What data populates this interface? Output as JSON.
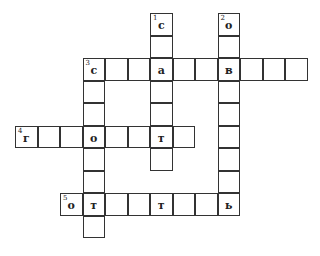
{
  "puzzle": {
    "cell_size": 22.5,
    "origin": {
      "x": 15,
      "y": 13
    },
    "cells": [
      {
        "r": 0,
        "c": 6,
        "num": "1",
        "ch": "с"
      },
      {
        "r": 1,
        "c": 6
      },
      {
        "r": 3,
        "c": 6
      },
      {
        "r": 4,
        "c": 6
      },
      {
        "r": 6,
        "c": 6
      },
      {
        "r": 0,
        "c": 9,
        "num": "2",
        "ch": "о"
      },
      {
        "r": 1,
        "c": 9
      },
      {
        "r": 3,
        "c": 9
      },
      {
        "r": 4,
        "c": 9
      },
      {
        "r": 5,
        "c": 9
      },
      {
        "r": 6,
        "c": 9
      },
      {
        "r": 7,
        "c": 9
      },
      {
        "r": 2,
        "c": 3,
        "num": "3",
        "ch": "с"
      },
      {
        "r": 2,
        "c": 4
      },
      {
        "r": 2,
        "c": 5
      },
      {
        "r": 2,
        "c": 6,
        "ch": "а"
      },
      {
        "r": 2,
        "c": 7
      },
      {
        "r": 2,
        "c": 8
      },
      {
        "r": 2,
        "c": 9,
        "ch": "в"
      },
      {
        "r": 2,
        "c": 10
      },
      {
        "r": 2,
        "c": 11
      },
      {
        "r": 2,
        "c": 12
      },
      {
        "r": 3,
        "c": 3
      },
      {
        "r": 4,
        "c": 3
      },
      {
        "r": 6,
        "c": 3
      },
      {
        "r": 7,
        "c": 3
      },
      {
        "r": 9,
        "c": 3
      },
      {
        "r": 5,
        "c": 0,
        "num": "4",
        "ch": "г"
      },
      {
        "r": 5,
        "c": 1
      },
      {
        "r": 5,
        "c": 2
      },
      {
        "r": 5,
        "c": 3,
        "ch": "о"
      },
      {
        "r": 5,
        "c": 4
      },
      {
        "r": 5,
        "c": 5
      },
      {
        "r": 5,
        "c": 6,
        "ch": "т"
      },
      {
        "r": 5,
        "c": 7
      },
      {
        "r": 8,
        "c": 2,
        "num": "5",
        "ch": "о"
      },
      {
        "r": 8,
        "c": 3,
        "ch": "т"
      },
      {
        "r": 8,
        "c": 4
      },
      {
        "r": 8,
        "c": 5
      },
      {
        "r": 8,
        "c": 6,
        "ch": "т"
      },
      {
        "r": 8,
        "c": 7
      },
      {
        "r": 8,
        "c": 8
      },
      {
        "r": 8,
        "c": 9,
        "ch": "ь"
      }
    ]
  }
}
